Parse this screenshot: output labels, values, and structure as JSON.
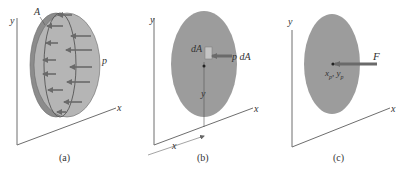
{
  "figure": {
    "colors": {
      "axis": "#6e6e6e",
      "ellipse_dark": "#8c8c8c",
      "ellipse_light": "#b5b5b5",
      "ellipse_flat": "#9c9c9c",
      "arrow": "#6a6a6a",
      "outline": "#555555",
      "text": "#333333"
    },
    "panels": [
      {
        "id": "a",
        "caption": "(a)",
        "axis_x_label": "x",
        "axis_y_label": "y",
        "area_label": "A",
        "pressure_label": "p"
      },
      {
        "id": "b",
        "caption": "(b)",
        "axis_x_label": "x",
        "axis_y_label": "y",
        "element_label": "dA",
        "force_label": "p dA",
        "y_distance_label": "y",
        "x_distance_label": "x"
      },
      {
        "id": "c",
        "caption": "(c)",
        "axis_x_label": "x",
        "axis_y_label": "y",
        "force_label": "F",
        "point_label_x": "x",
        "point_label_x_sub": "p",
        "point_label_sep": ", ",
        "point_label_y": "y",
        "point_label_y_sub": "p"
      }
    ]
  }
}
